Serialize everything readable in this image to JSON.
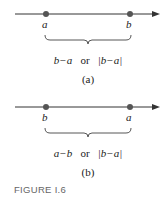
{
  "diagram_a": {
    "left_point": "a",
    "right_point": "b",
    "expr1": "b−a",
    "or": "or",
    "expr2": "|b−a|",
    "caption": "(a)"
  },
  "diagram_b": {
    "left_point": "b",
    "right_point": "a",
    "expr1": "a−b",
    "or": "or",
    "expr2": "|b−a|",
    "caption": "(b)"
  },
  "figure_label": "FIGURE I.6",
  "colors": {
    "line": "#333333",
    "dot": "#555555",
    "caption": "#666666"
  }
}
